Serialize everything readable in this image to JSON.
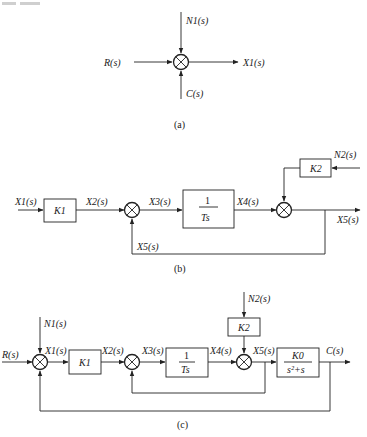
{
  "header": {
    "cut_text": ""
  },
  "diagram_a": {
    "caption": "(a)",
    "inputs": {
      "left": "R(s)",
      "top": "N1(s)",
      "bottom": "C(s)"
    },
    "output": "X1(s)"
  },
  "diagram_b": {
    "caption": "(b)",
    "input": "X1(s)",
    "blocks": {
      "k1": "K1",
      "integrator_num": "1",
      "integrator_den": "Ts",
      "k2": "K2"
    },
    "signals": {
      "x2": "X2(s)",
      "x3": "X3(s)",
      "x4": "X4(s)",
      "x5": "X5(s)",
      "feedback": "X5(s)",
      "n2": "N2(s)"
    }
  },
  "diagram_c": {
    "caption": "(c)",
    "input": "R(s)",
    "output": "C(s)",
    "blocks": {
      "k1": "K1",
      "integrator_num": "1",
      "integrator_den": "Ts",
      "k2": "K2",
      "plant_num": "K0",
      "plant_den": "s²+s"
    },
    "signals": {
      "n1": "N1(s)",
      "x1": "X1(s)",
      "x2": "X2(s)",
      "x3": "X3(s)",
      "x4": "X4(s)",
      "x5": "X5(s)",
      "n2": "N2(s)"
    }
  }
}
